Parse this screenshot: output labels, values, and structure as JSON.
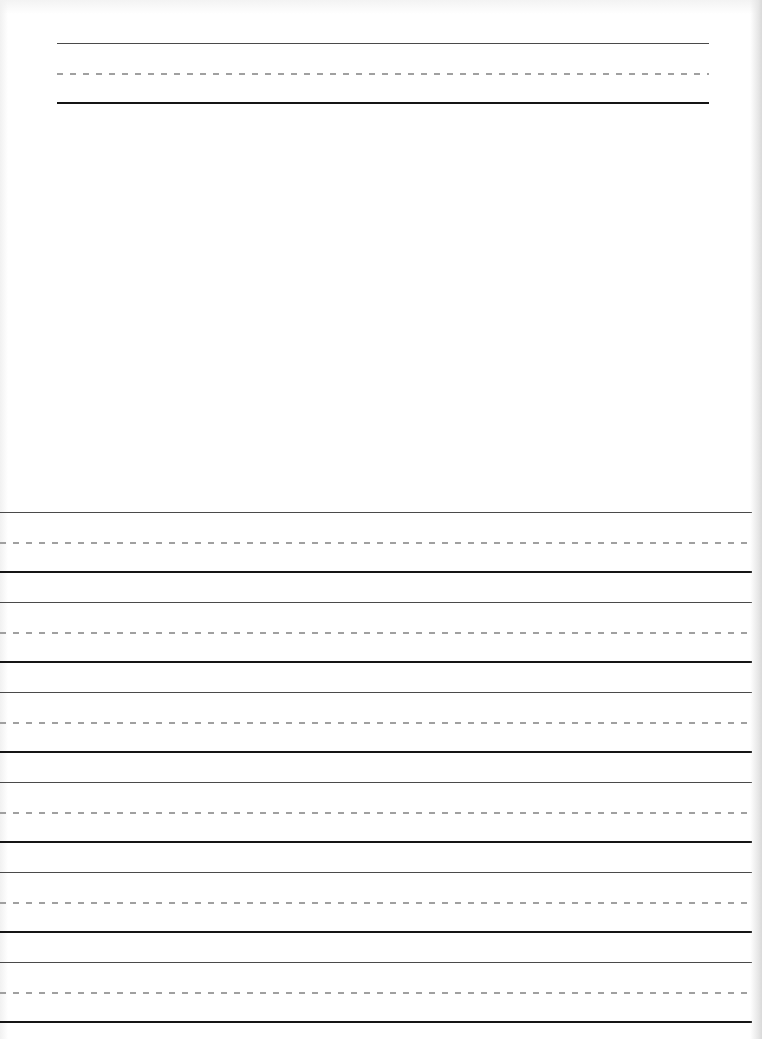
{
  "document": {
    "type": "handwriting-practice-sheet",
    "colors": {
      "background": "#ffffff",
      "top_line": "#4a4a4a",
      "midline_dashes": "#a0a0a0",
      "baseline": "#151515"
    },
    "title_block": {
      "left": 57,
      "width": 652,
      "top_line_y": 43,
      "midline_y": 73,
      "baseline_y": 102
    },
    "drawing_area": {
      "top": 110,
      "bottom": 505,
      "content": ""
    },
    "writing_lines": {
      "left": 0,
      "width": 752,
      "sets": [
        {
          "top_line_y": 512,
          "midline_y": 542,
          "baseline_y": 571
        },
        {
          "top_line_y": 602,
          "midline_y": 632,
          "baseline_y": 661
        },
        {
          "top_line_y": 692,
          "midline_y": 722,
          "baseline_y": 751
        },
        {
          "top_line_y": 782,
          "midline_y": 812,
          "baseline_y": 841
        },
        {
          "top_line_y": 872,
          "midline_y": 902,
          "baseline_y": 931
        },
        {
          "top_line_y": 962,
          "midline_y": 992,
          "baseline_y": 1021
        }
      ]
    }
  }
}
